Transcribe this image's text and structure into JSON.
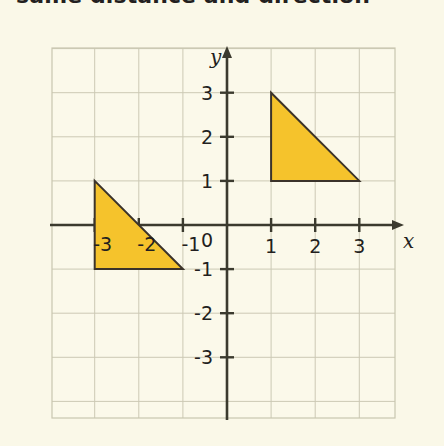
{
  "heading": {
    "text": "same distance and direction"
  },
  "colors": {
    "page_background": "#faf8e8",
    "plot_background": "#fbf9ea",
    "grid_line": "#ccc9b4",
    "grid_border": "#c9c6b0",
    "axis": "#3b3a2e",
    "shape_fill": "#f5c32c",
    "shape_stroke": "#3b332a",
    "text": "#231f20"
  },
  "chart_data": {
    "type": "scatter",
    "title": "",
    "xlabel": "x",
    "ylabel": "y",
    "grid": true,
    "legend": false,
    "xlim": [
      -4,
      4
    ],
    "ylim": [
      -4,
      4
    ],
    "x_ticks": [
      -3,
      -2,
      -1,
      0,
      1,
      2,
      3
    ],
    "y_ticks": [
      -3,
      -2,
      -1,
      1,
      2,
      3
    ],
    "x_tick_labels": [
      "-3",
      "-2",
      "-1",
      "0",
      "1",
      "2",
      "3"
    ],
    "y_tick_labels": [
      "-3",
      "-2",
      "-1",
      "1",
      "2",
      "3"
    ],
    "origin_label": "0",
    "shapes": [
      {
        "name": "preimage-triangle",
        "type": "polygon",
        "vertices": [
          [
            -3,
            1
          ],
          [
            -3,
            -1
          ],
          [
            -1,
            -1
          ]
        ],
        "fill": "#f5c32c",
        "stroke": "#3b332a"
      },
      {
        "name": "image-triangle",
        "type": "polygon",
        "vertices": [
          [
            1,
            3
          ],
          [
            1,
            1
          ],
          [
            3,
            1
          ]
        ],
        "fill": "#f5c32c",
        "stroke": "#3b332a"
      }
    ],
    "annotations": []
  }
}
